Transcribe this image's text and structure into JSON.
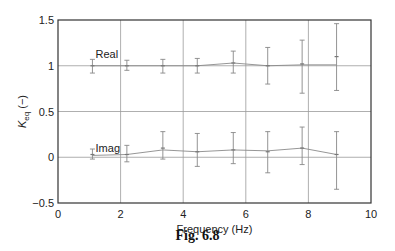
{
  "figure": {
    "caption": "Fig. 6.8"
  },
  "chart_data": {
    "type": "line",
    "title": "",
    "xlabel": "Frequency (Hz)",
    "ylabel": "K_eq (−)",
    "ylabel_main": "K",
    "ylabel_sub": "eq",
    "ylabel_unit": " (−)",
    "xlim": [
      0,
      10
    ],
    "ylim": [
      -0.5,
      1.5
    ],
    "xticks": [
      0,
      2,
      4,
      6,
      8,
      10
    ],
    "xtick_labels": [
      "0",
      "2",
      "4",
      "6",
      "8",
      "10"
    ],
    "yticks": [
      -0.5,
      0,
      0.5,
      1,
      1.5
    ],
    "ytick_labels": [
      "−0.5",
      "0",
      "0.5",
      "1",
      "1.5"
    ],
    "grid": true,
    "legend": "none (inline labels)",
    "x": [
      1.1,
      2.2,
      3.35,
      4.45,
      5.6,
      6.7,
      7.8,
      8.9
    ],
    "series": [
      {
        "name": "Real",
        "label_position": {
          "x": 1.2,
          "y": 1.09
        },
        "values": [
          1.0,
          1.0,
          1.0,
          1.0,
          1.03,
          1.0,
          1.02,
          1.1
        ],
        "error_low": [
          0.92,
          0.95,
          0.92,
          0.92,
          0.92,
          0.8,
          0.7,
          0.73
        ],
        "error_high": [
          1.07,
          1.06,
          1.07,
          1.08,
          1.16,
          1.2,
          1.28,
          1.46
        ],
        "line_values": [
          1.0,
          1.0,
          1.0,
          1.0,
          1.03,
          1.0,
          1.01,
          1.01
        ]
      },
      {
        "name": "Imag",
        "label_position": {
          "x": 1.2,
          "y": 0.06
        },
        "values": [
          0.03,
          0.03,
          0.1,
          0.06,
          0.08,
          0.06,
          0.1,
          0.03
        ],
        "error_low": [
          -0.02,
          -0.05,
          -0.02,
          -0.1,
          -0.07,
          -0.17,
          -0.08,
          -0.35
        ],
        "error_high": [
          0.09,
          0.13,
          0.28,
          0.26,
          0.27,
          0.28,
          0.33,
          0.28
        ],
        "line_values": [
          0.02,
          0.03,
          0.08,
          0.06,
          0.08,
          0.07,
          0.1,
          0.03
        ]
      }
    ]
  }
}
